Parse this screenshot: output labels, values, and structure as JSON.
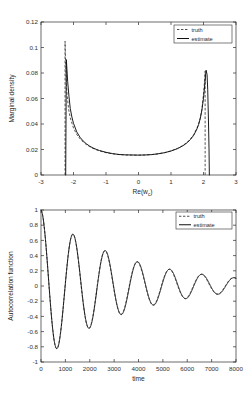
{
  "chart_data": [
    {
      "id": "marginal-density",
      "type": "line",
      "title": "",
      "xlabel": "Re(w_c)",
      "xlabel_main": "Re(w",
      "xlabel_sub": "c",
      "xlabel_close": ")",
      "ylabel": "Marginal density",
      "xlim": [
        -3,
        3
      ],
      "ylim": [
        0,
        0.12
      ],
      "xticks": [
        -3,
        -2,
        -1,
        0,
        1,
        2,
        3
      ],
      "xticklabels": [
        "-3",
        "-2",
        "-1",
        "0",
        "1",
        "2",
        "3"
      ],
      "yticks": [
        0,
        0.02,
        0.04,
        0.06,
        0.08,
        0.1,
        0.12
      ],
      "yticklabels": [
        "0",
        "0.02",
        "0.04",
        "0.06",
        "0.08",
        "0.1",
        "0.12"
      ],
      "grid": false,
      "legend_position": "top-right",
      "series": [
        {
          "name": "truth",
          "style": "dashed",
          "color": "#3a3a3a",
          "x": [
            -2.26,
            -2.26,
            -2.24,
            -2.22,
            -2.2,
            -2.15,
            -2.1,
            -2.0,
            -1.9,
            -1.8,
            -1.7,
            -1.6,
            -1.5,
            -1.4,
            -1.3,
            -1.2,
            -1.0,
            -0.8,
            -0.6,
            -0.4,
            -0.2,
            0.0,
            0.2,
            0.4,
            0.6,
            0.8,
            1.0,
            1.2,
            1.3,
            1.4,
            1.5,
            1.6,
            1.7,
            1.8,
            1.85,
            1.9,
            1.95,
            2.0,
            2.03,
            2.05,
            2.05
          ],
          "y": [
            0.0,
            0.105,
            0.0845,
            0.0715,
            0.0635,
            0.0515,
            0.0448,
            0.0368,
            0.0318,
            0.0284,
            0.0258,
            0.0238,
            0.0222,
            0.0209,
            0.0198,
            0.0189,
            0.0175,
            0.0166,
            0.016,
            0.0157,
            0.0156,
            0.0156,
            0.0157,
            0.016,
            0.0166,
            0.0175,
            0.0189,
            0.0209,
            0.0222,
            0.0238,
            0.0258,
            0.0284,
            0.0318,
            0.0368,
            0.0402,
            0.0448,
            0.0515,
            0.0635,
            0.0725,
            0.0815,
            0.0
          ]
        },
        {
          "name": "estimate",
          "style": "solid",
          "color": "#111111",
          "x": [
            -2.24,
            -2.22,
            -2.18,
            -2.14,
            -2.1,
            -2.05,
            -2.0,
            -1.9,
            -1.8,
            -1.7,
            -1.6,
            -1.5,
            -1.4,
            -1.3,
            -1.2,
            -1.0,
            -0.8,
            -0.6,
            -0.4,
            -0.2,
            0.0,
            0.2,
            0.4,
            0.6,
            0.8,
            1.0,
            1.2,
            1.3,
            1.4,
            1.5,
            1.6,
            1.7,
            1.8,
            1.85,
            1.9,
            1.95,
            2.0,
            2.04,
            2.08,
            2.11,
            2.13,
            2.15,
            2.17,
            2.18
          ],
          "y": [
            0.0,
            0.0905,
            0.0735,
            0.0618,
            0.0522,
            0.0455,
            0.0405,
            0.0338,
            0.0296,
            0.0266,
            0.0244,
            0.0226,
            0.0212,
            0.0201,
            0.0192,
            0.0178,
            0.0168,
            0.0161,
            0.0158,
            0.0157,
            0.0156,
            0.0157,
            0.016,
            0.0166,
            0.0175,
            0.0188,
            0.0207,
            0.022,
            0.0235,
            0.0254,
            0.0279,
            0.0312,
            0.0362,
            0.0396,
            0.0442,
            0.0508,
            0.0602,
            0.0712,
            0.0822,
            0.0788,
            0.0668,
            0.0455,
            0.0205,
            0.0
          ]
        }
      ]
    },
    {
      "id": "autocorrelation-function",
      "type": "line",
      "title": "",
      "xlabel": "time",
      "ylabel": "Autocorrelation function",
      "xlim": [
        0,
        8000
      ],
      "ylim": [
        -1,
        1
      ],
      "xticks": [
        0,
        1000,
        2000,
        3000,
        4000,
        5000,
        6000,
        7000,
        8000
      ],
      "xticklabels": [
        "0",
        "1000",
        "2000",
        "3000",
        "4000",
        "5000",
        "6000",
        "7000",
        "8000"
      ],
      "yticks": [
        -1,
        -0.8,
        -0.6,
        -0.4,
        -0.2,
        0,
        0.2,
        0.4,
        0.6,
        0.8,
        1
      ],
      "yticklabels": [
        "-1",
        "-0.8",
        "-0.6",
        "-0.4",
        "-0.2",
        "0",
        "0.2",
        "0.4",
        "0.6",
        "0.8",
        "1"
      ],
      "grid": false,
      "legend_position": "top-right",
      "model": {
        "form": "damped_cosine",
        "amplitude": 1.0,
        "decay_time": 3400,
        "period": 1320,
        "phase_offset": 0
      },
      "series": [
        {
          "name": "truth",
          "style": "dashed",
          "color": "#3a3a3a",
          "decay_time": 3380,
          "period": 1318,
          "amplitude": 1.0,
          "offset": 0.012
        },
        {
          "name": "estimate",
          "style": "solid",
          "color": "#111111",
          "decay_time": 3420,
          "period": 1322,
          "amplitude": 1.0,
          "offset": 0.012
        }
      ],
      "peaks": [
        {
          "time": 0,
          "value": 1.0
        },
        {
          "time": 660,
          "value": -0.92
        },
        {
          "time": 1320,
          "value": 0.82
        },
        {
          "time": 1980,
          "value": -0.75
        },
        {
          "time": 2640,
          "value": 0.66
        },
        {
          "time": 3300,
          "value": -0.57
        },
        {
          "time": 3960,
          "value": 0.49
        },
        {
          "time": 4620,
          "value": -0.4
        },
        {
          "time": 5280,
          "value": 0.34
        },
        {
          "time": 5940,
          "value": -0.24
        },
        {
          "time": 6600,
          "value": 0.19
        },
        {
          "time": 7260,
          "value": -0.08
        },
        {
          "time": 7900,
          "value": 0.02
        }
      ]
    }
  ],
  "legend": {
    "items": [
      {
        "label": "truth",
        "style": "dashed"
      },
      {
        "label": "estimate",
        "style": "solid"
      }
    ]
  }
}
